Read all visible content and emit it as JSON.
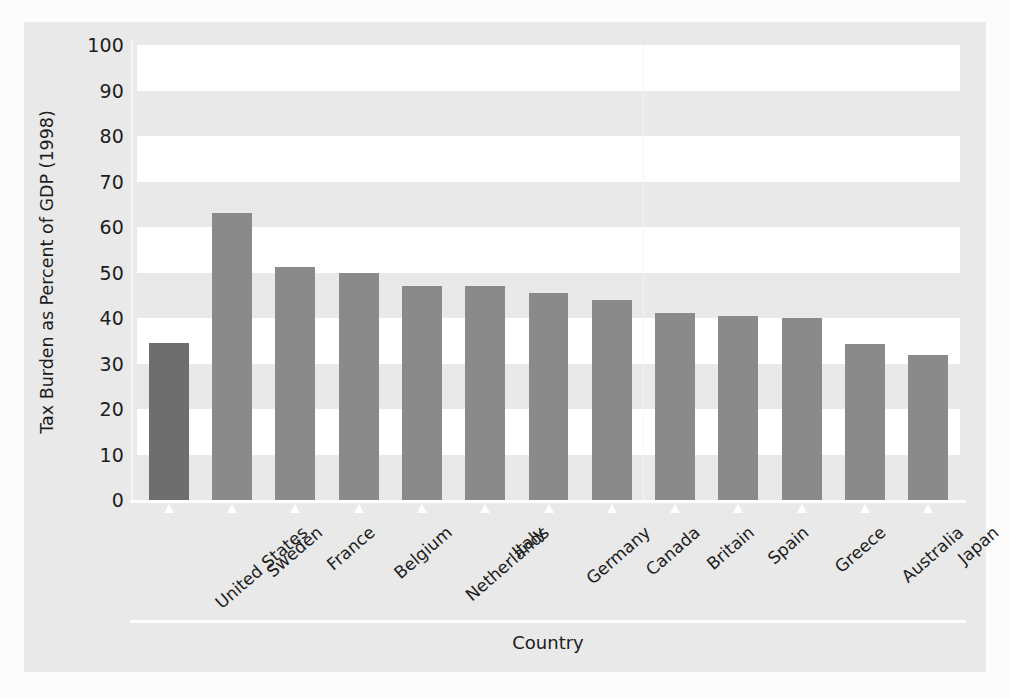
{
  "chart_data": {
    "type": "bar",
    "title": "",
    "xlabel": "Country",
    "ylabel": "Tax Burden as Percent of GDP (1998)",
    "categories": [
      "United States",
      "Sweden",
      "France",
      "Belgium",
      "Netherlands",
      "Italy",
      "Germany",
      "Canada",
      "Britain",
      "Spain",
      "Greece",
      "Australia",
      "Japan"
    ],
    "values": [
      34.5,
      63,
      51.2,
      50,
      47,
      47,
      45.5,
      44,
      41,
      40.5,
      40,
      34.3,
      31.8
    ],
    "ylim": [
      0,
      100
    ],
    "ytick_labels": [
      "100",
      "90",
      "80",
      "70",
      "60",
      "50",
      "40",
      "30",
      "20",
      "10",
      "0"
    ],
    "ytick_values": [
      100,
      90,
      80,
      70,
      60,
      50,
      40,
      30,
      20,
      10,
      0
    ],
    "grid": false,
    "banded_background": true,
    "legend": "none",
    "bar_color": "#8a8a8a",
    "highlight_bar_color": "#6e6e6e",
    "highlight_category": "United States",
    "plot_background": "#e9e9e9",
    "band_color": "#ffffff",
    "axis_color": "#ffffff"
  }
}
